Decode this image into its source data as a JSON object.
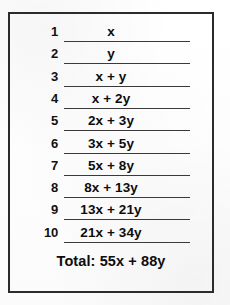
{
  "worksheet": {
    "title": "Fibonacci sequence worksheet",
    "border_color": "#2b2b2b",
    "line_color": "#3a3a3a",
    "text_color": "#0d0d0d",
    "background_color": "#fdfdfd",
    "rows": [
      {
        "number": "1",
        "expression": "x"
      },
      {
        "number": "2",
        "expression": "y"
      },
      {
        "number": "3",
        "expression": "x + y"
      },
      {
        "number": "4",
        "expression": "x + 2y"
      },
      {
        "number": "5",
        "expression": "2x + 3y"
      },
      {
        "number": "6",
        "expression": "3x + 5y"
      },
      {
        "number": "7",
        "expression": "5x + 8y"
      },
      {
        "number": "8",
        "expression": "8x + 13y"
      },
      {
        "number": "9",
        "expression": "13x + 21y"
      },
      {
        "number": "10",
        "expression": "21x + 34y"
      }
    ],
    "total": {
      "label": "Total:",
      "expression": "55x + 88y",
      "full_text": "Total: 55x + 88y"
    }
  }
}
